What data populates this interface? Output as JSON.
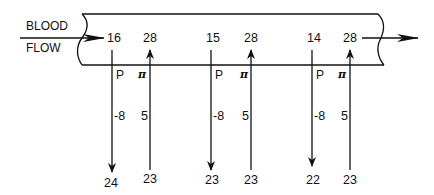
{
  "flow_label": {
    "line1": "BLOOD",
    "line2": "FLOW"
  },
  "segments": [
    {
      "p_top": "16",
      "pi_top": "28",
      "p_label": "P",
      "pi_label": "π",
      "p_net": "-8",
      "pi_net": "5",
      "p_bottom": "24",
      "pi_bottom": "23"
    },
    {
      "p_top": "15",
      "pi_top": "28",
      "p_label": "P",
      "pi_label": "π",
      "p_net": "-8",
      "pi_net": "5",
      "p_bottom": "23",
      "pi_bottom": "23"
    },
    {
      "p_top": "14",
      "pi_top": "28",
      "p_label": "P",
      "pi_label": "π",
      "p_net": "-8",
      "pi_net": "5",
      "p_bottom": "22",
      "pi_bottom": "23"
    }
  ],
  "colors": {
    "line": "#111111",
    "background": "#ffffff"
  }
}
